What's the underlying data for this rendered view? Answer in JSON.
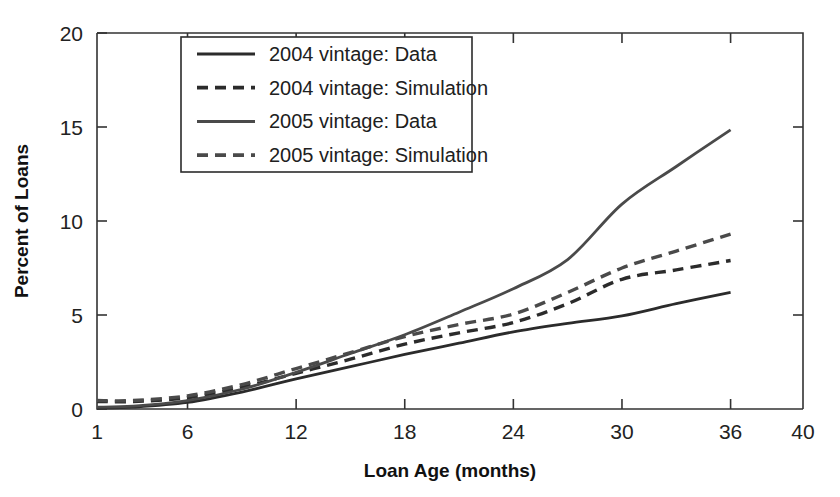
{
  "chart_data": {
    "type": "line",
    "title": "",
    "xlabel": "Loan Age (months)",
    "ylabel": "Percent of Loans",
    "xlim": [
      1,
      40
    ],
    "ylim": [
      0,
      20
    ],
    "xticks": [
      1,
      6,
      12,
      18,
      24,
      30,
      36,
      40
    ],
    "xtick_labels": [
      "1",
      "6",
      "12",
      "18",
      "24",
      "30",
      "36",
      "40"
    ],
    "yticks": [
      0,
      5,
      10,
      15,
      20
    ],
    "ytick_labels": [
      "0",
      "5",
      "10",
      "15",
      "20"
    ],
    "grid": false,
    "legend_position": "upper left inside",
    "x": [
      1,
      3,
      6,
      9,
      12,
      15,
      18,
      21,
      24,
      27,
      30,
      33,
      36
    ],
    "series": [
      {
        "name": "2004 vintage: Data",
        "style": "solid",
        "color": "#2b2b2b",
        "values": [
          0.05,
          0.1,
          0.35,
          0.9,
          1.6,
          2.25,
          2.9,
          3.5,
          4.1,
          4.55,
          4.95,
          5.6,
          6.2
        ]
      },
      {
        "name": "2004 vintage: Simulation",
        "style": "dashed",
        "color": "#2b2b2b",
        "values": [
          0.4,
          0.4,
          0.6,
          1.15,
          1.9,
          2.65,
          3.45,
          4.05,
          4.6,
          5.6,
          6.9,
          7.4,
          7.9
        ]
      },
      {
        "name": "2005 vintage: Data",
        "style": "solid",
        "color": "#4a4a4a",
        "values": [
          0.1,
          0.15,
          0.45,
          1.05,
          1.95,
          2.95,
          3.95,
          5.15,
          6.4,
          7.95,
          10.9,
          12.9,
          14.85
        ]
      },
      {
        "name": "2005 vintage: Simulation",
        "style": "dashed",
        "color": "#4a4a4a",
        "values": [
          0.45,
          0.45,
          0.7,
          1.3,
          2.15,
          3.0,
          3.85,
          4.5,
          5.05,
          6.2,
          7.5,
          8.4,
          9.3
        ]
      }
    ]
  },
  "legend": {
    "entries": [
      {
        "label": "2004 vintage: Data"
      },
      {
        "label": "2004 vintage: Simulation"
      },
      {
        "label": "2005 vintage: Data"
      },
      {
        "label": "2005 vintage: Simulation"
      }
    ]
  },
  "axes": {
    "x_title": "Loan Age (months)",
    "y_title": "Percent of Loans",
    "x_tick_labels": [
      "1",
      "6",
      "12",
      "18",
      "24",
      "30",
      "36",
      "40"
    ],
    "y_tick_labels": [
      "0",
      "5",
      "10",
      "15",
      "20"
    ]
  }
}
